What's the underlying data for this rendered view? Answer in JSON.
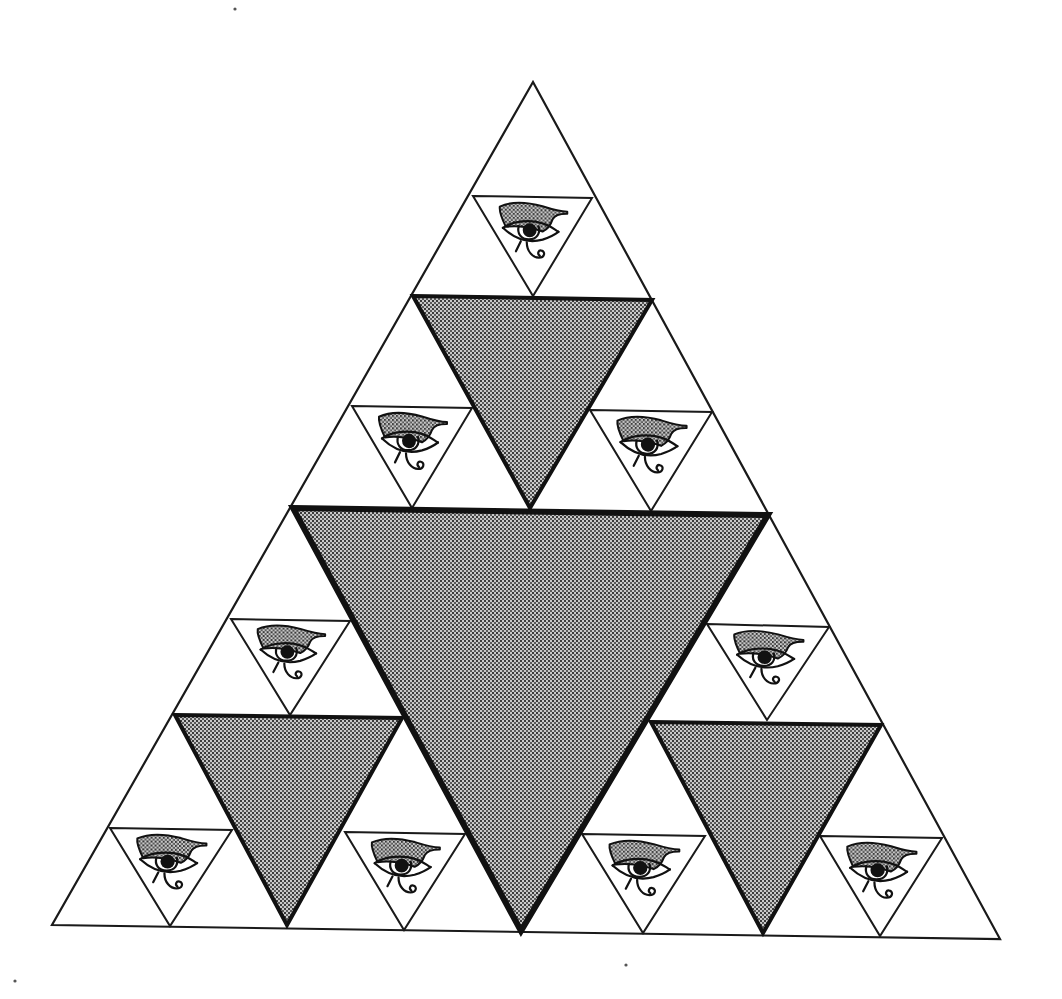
{
  "figure": {
    "colors": {
      "background": "#ffffff",
      "line": "#1a1a1a",
      "shade_base": "#bdbdbd",
      "shade_dot": "#2a2a2a"
    },
    "outer_triangle": {
      "points": [
        [
          533,
          82
        ],
        [
          52,
          925
        ],
        [
          1000,
          939
        ]
      ]
    },
    "subdivision_lines": [
      [
        [
          293,
          508
        ],
        [
          768,
          515
        ]
      ],
      [
        [
          293,
          508
        ],
        [
          521,
          931
        ]
      ],
      [
        [
          768,
          515
        ],
        [
          521,
          931
        ]
      ],
      [
        [
          413,
          296
        ],
        [
          652,
          300
        ]
      ],
      [
        [
          175,
          715
        ],
        [
          402,
          718
        ]
      ],
      [
        [
          651,
          722
        ],
        [
          881,
          725
        ]
      ]
    ],
    "shaded_triangles": [
      {
        "name": "center-large",
        "points": [
          [
            293,
            508
          ],
          [
            768,
            515
          ],
          [
            521,
            931
          ]
        ],
        "stroke_width": 6
      },
      {
        "name": "top-medium",
        "points": [
          [
            413,
            296
          ],
          [
            652,
            300
          ],
          [
            530,
            508
          ]
        ],
        "stroke_width": 4
      },
      {
        "name": "left-medium",
        "points": [
          [
            175,
            715
          ],
          [
            402,
            718
          ],
          [
            287,
            925
          ]
        ],
        "stroke_width": 4
      },
      {
        "name": "right-medium",
        "points": [
          [
            651,
            722
          ],
          [
            881,
            725
          ],
          [
            763,
            933
          ]
        ],
        "stroke_width": 4
      }
    ],
    "eye_triangles": [
      {
        "name": "eye-top",
        "points": [
          [
            473,
            196
          ],
          [
            592,
            198
          ],
          [
            533,
            296
          ]
        ]
      },
      {
        "name": "eye-upper-left",
        "points": [
          [
            352,
            406
          ],
          [
            472,
            408
          ],
          [
            412,
            508
          ]
        ]
      },
      {
        "name": "eye-upper-right",
        "points": [
          [
            590,
            410
          ],
          [
            712,
            412
          ],
          [
            651,
            511
          ]
        ]
      },
      {
        "name": "eye-mid-left",
        "points": [
          [
            231,
            619
          ],
          [
            350,
            621
          ],
          [
            290,
            715
          ]
        ]
      },
      {
        "name": "eye-mid-right",
        "points": [
          [
            707,
            624
          ],
          [
            829,
            627
          ],
          [
            767,
            720
          ]
        ]
      },
      {
        "name": "eye-bottom-1",
        "points": [
          [
            110,
            828
          ],
          [
            232,
            830
          ],
          [
            170,
            926
          ]
        ]
      },
      {
        "name": "eye-bottom-2",
        "points": [
          [
            345,
            832
          ],
          [
            465,
            834
          ],
          [
            404,
            930
          ]
        ]
      },
      {
        "name": "eye-bottom-3",
        "points": [
          [
            582,
            834
          ],
          [
            705,
            836
          ],
          [
            643,
            933
          ]
        ]
      },
      {
        "name": "eye-bottom-4",
        "points": [
          [
            820,
            836
          ],
          [
            942,
            838
          ],
          [
            880,
            936
          ]
        ]
      }
    ],
    "eye_motif": "eye-of-horus",
    "scan_marks": [
      [
        15,
        981
      ],
      [
        235,
        9
      ],
      [
        626,
        965
      ]
    ]
  }
}
